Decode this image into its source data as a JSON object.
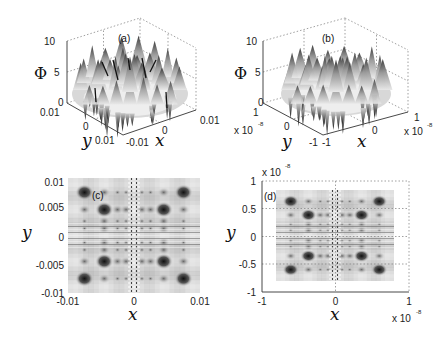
{
  "chart_data": [
    {
      "id": "a",
      "type": "surface3d",
      "panel_label": "(a)",
      "zlabel": "Φ",
      "xlabel": "x",
      "ylabel": "y",
      "zlim": [
        0,
        10
      ],
      "zticks": [
        "0",
        "5",
        "10"
      ],
      "xlim": [
        -0.01,
        0.01
      ],
      "xticks": [
        "-0.01",
        "0",
        "0.01"
      ],
      "ylim": [
        -0.01,
        0.01
      ],
      "yticks": [
        "0.01",
        "0",
        "-0.01"
      ],
      "yticks_display": [
        "0.01",
        "0",
        "0.01"
      ],
      "exponent": "",
      "grid": true,
      "colormap": "gray",
      "description": "Rippled radially-symmetric surface with peaks up to ~8 and deep minima near 0"
    },
    {
      "id": "b",
      "type": "surface3d",
      "panel_label": "(b)",
      "zlabel": "Φ",
      "xlabel": "x",
      "ylabel": "y",
      "zlim": [
        0,
        10
      ],
      "zticks": [
        "0",
        "5",
        "10"
      ],
      "xlim": [
        -1e-08,
        1e-08
      ],
      "xticks": [
        "-1",
        "0",
        "1"
      ],
      "ylim": [
        -1e-08,
        1e-08
      ],
      "yticks": [
        "1",
        "0",
        "-1"
      ],
      "exponent": "x 10",
      "exponent_power": "-8",
      "grid": true,
      "colormap": "gray",
      "description": "Rippled radially-symmetric surface with peaks up to ~7 and minima near 0"
    },
    {
      "id": "c",
      "type": "heatmap",
      "panel_label": "(c)",
      "xlabel": "x",
      "ylabel": "y",
      "xlim": [
        -0.01,
        0.01
      ],
      "ylim": [
        -0.01,
        0.01
      ],
      "xticks": [
        "-0.01",
        "0",
        "0.01"
      ],
      "yticks": [
        "0.01",
        "0.005",
        "0",
        "-0.005",
        "-0.01"
      ],
      "grid": false,
      "colormap": "gray",
      "extent": [
        -0.01,
        0.01,
        -0.01,
        0.01
      ]
    },
    {
      "id": "d",
      "type": "heatmap",
      "panel_label": "(d)",
      "xlabel": "x",
      "ylabel": "y",
      "xlim": [
        -1,
        1
      ],
      "ylim": [
        -1,
        1
      ],
      "xticks": [
        "-1",
        "0",
        "1"
      ],
      "yticks": [
        "1",
        "0.5",
        "0",
        "-0.5",
        "-1"
      ],
      "exponent": "x 10",
      "exponent_power": "-8",
      "grid": true,
      "colormap": "gray",
      "extent": [
        -0.8,
        0.8,
        -0.8,
        0.8
      ]
    }
  ]
}
